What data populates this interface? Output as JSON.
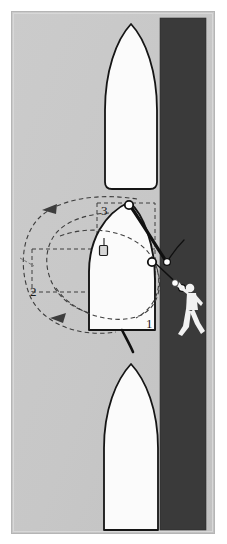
{
  "figure": {
    "type": "nautical-manoeuvring-diagram",
    "background_color": "#ffffff"
  },
  "canvas": {
    "width": 227,
    "height": 544,
    "frame": {
      "x": 11,
      "y": 11,
      "width": 204,
      "height": 523,
      "border_color": "#b9b9b9",
      "fill": "#c9c9c9"
    }
  },
  "water": {
    "name": "water-area",
    "color": "#c9c9c9"
  },
  "quay": {
    "name": "quay-dock-strip",
    "color": "#3a3a3a",
    "x": 160,
    "y": 18,
    "width": 46,
    "height": 512
  },
  "vessels": [
    {
      "id": "vessel-ahead",
      "label": "boat-ahead",
      "fill": "#fbfbfb",
      "outline": "#151515"
    },
    {
      "id": "vessel-subject",
      "label": "boat-subject",
      "fill": "#fbfbfb",
      "outline": "#151515"
    },
    {
      "id": "vessel-astern",
      "label": "boat-astern",
      "fill": "#fbfbfb",
      "outline": "#151515"
    }
  ],
  "steps": [
    {
      "id": "step-1",
      "text": "1",
      "x": 148,
      "y": 323
    },
    {
      "id": "step-2",
      "text": "2",
      "x": 32,
      "y": 292
    },
    {
      "id": "step-3",
      "text": "3",
      "x": 102,
      "y": 211
    }
  ],
  "annotations": {
    "swing_arcs": {
      "name": "swing-arc-dashed",
      "color": "#3d3d3d",
      "dash": "4 3",
      "arrowheads": 2
    },
    "guide_box": {
      "name": "guide-rectangle-dashed",
      "color": "#3d3d3d",
      "dash": "4 3"
    },
    "bow_spring_line": {
      "name": "bow-spring-line",
      "color": "#101010"
    },
    "stern_line": {
      "name": "stern-line",
      "color": "#101010"
    },
    "heaving_line": {
      "name": "heaving-line",
      "color": "#101010"
    }
  },
  "fittings": [
    {
      "id": "bow-cleat",
      "name": "bow-cleat-circle",
      "cx": 129,
      "cy": 205,
      "r": 4
    },
    {
      "id": "mid-cleat",
      "name": "midship-cleat-circle",
      "cx": 152,
      "cy": 262,
      "r": 4
    },
    {
      "id": "quay-bollard-upper",
      "name": "quay-bollard-upper",
      "cx": 167,
      "cy": 262,
      "r": 3.2
    },
    {
      "id": "quay-bollard-lower",
      "name": "quay-bollard-lower",
      "cx": 173,
      "cy": 290,
      "r": 3.2
    },
    {
      "id": "deck-winch",
      "name": "deck-winch-marker",
      "x": 99,
      "y": 243
    }
  ],
  "person": {
    "name": "crew-throwing-heaving-line",
    "color": "#f2f2f2",
    "x": 172,
    "y": 285,
    "holding": "heaving-line-monkeys-fist"
  }
}
